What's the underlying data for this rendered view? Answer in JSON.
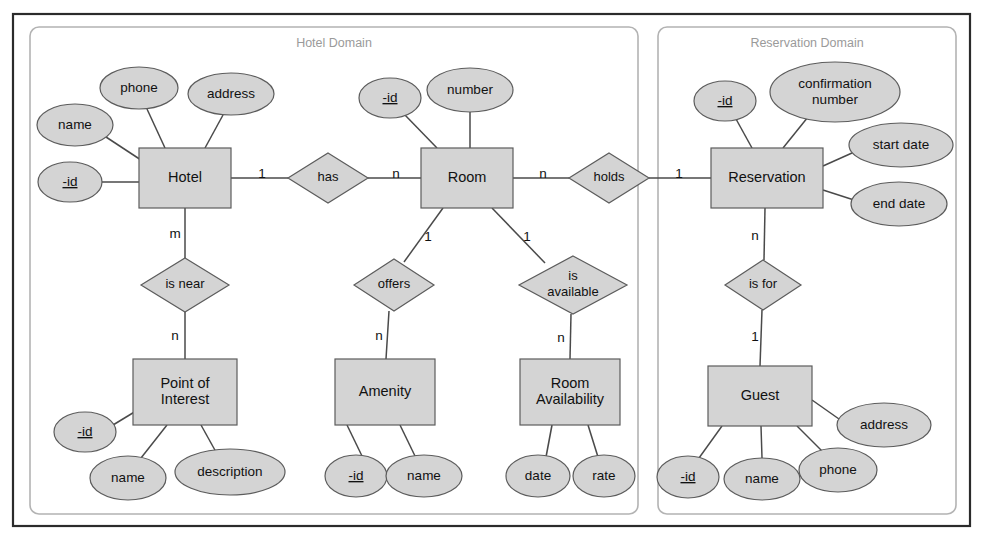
{
  "diagram": {
    "colors": {
      "shape_fill": "#d4d4d4",
      "shape_stroke": "#5c5c5c",
      "edge": "#4a4a4a",
      "domain_border": "#b3b3b3",
      "domain_label": "#9a9a9a",
      "outer_frame": "#2b2b2b",
      "background": "#ffffff"
    }
  },
  "domains": [
    {
      "id": "hotel-domain",
      "label": "Hotel Domain",
      "x": 30,
      "y": 27,
      "w": 608,
      "h": 487
    },
    {
      "id": "reservation-domain",
      "label": "Reservation Domain",
      "x": 658,
      "y": 27,
      "w": 298,
      "h": 487
    }
  ],
  "entities": [
    {
      "id": "hotel",
      "label": "Hotel",
      "cx": 185,
      "cy": 178,
      "w": 92,
      "h": 60,
      "lines": [
        "Hotel"
      ]
    },
    {
      "id": "room",
      "label": "Room",
      "cx": 467,
      "cy": 178,
      "w": 92,
      "h": 60,
      "lines": [
        "Room"
      ]
    },
    {
      "id": "reservation",
      "label": "Reservation",
      "cx": 767,
      "cy": 178,
      "w": 112,
      "h": 60,
      "lines": [
        "Reservation"
      ]
    },
    {
      "id": "point-of-interest",
      "label": "Point of Interest",
      "cx": 185,
      "cy": 392,
      "w": 104,
      "h": 66,
      "lines": [
        "Point of",
        "Interest"
      ]
    },
    {
      "id": "amenity",
      "label": "Amenity",
      "cx": 385,
      "cy": 392,
      "w": 100,
      "h": 66,
      "lines": [
        "Amenity"
      ]
    },
    {
      "id": "room-availability",
      "label": "Room Availability",
      "cx": 570,
      "cy": 392,
      "w": 100,
      "h": 66,
      "lines": [
        "Room",
        "Availability"
      ]
    },
    {
      "id": "guest",
      "label": "Guest",
      "cx": 760,
      "cy": 396,
      "w": 104,
      "h": 60,
      "lines": [
        "Guest"
      ]
    }
  ],
  "relationships": [
    {
      "id": "has",
      "label": "has",
      "cx": 328,
      "cy": 178,
      "rx": 40,
      "ry": 25,
      "lines": [
        "has"
      ]
    },
    {
      "id": "holds",
      "label": "holds",
      "cx": 609,
      "cy": 178,
      "rx": 40,
      "ry": 25,
      "lines": [
        "holds"
      ]
    },
    {
      "id": "is-near",
      "label": "is near",
      "cx": 185,
      "cy": 285,
      "rx": 44,
      "ry": 27,
      "lines": [
        "is near"
      ]
    },
    {
      "id": "offers",
      "label": "offers",
      "cx": 394,
      "cy": 285,
      "rx": 40,
      "ry": 26,
      "lines": [
        "offers"
      ]
    },
    {
      "id": "is-available",
      "label": "is available",
      "cx": 573,
      "cy": 285,
      "rx": 54,
      "ry": 29,
      "lines": [
        "is",
        "available"
      ]
    },
    {
      "id": "is-for",
      "label": "is for",
      "cx": 763,
      "cy": 285,
      "rx": 38,
      "ry": 25,
      "lines": [
        "is for"
      ]
    }
  ],
  "attributes": [
    {
      "id": "hotel-name",
      "label": "name",
      "key": false,
      "cx": 75,
      "cy": 125,
      "rx": 38,
      "ry": 21,
      "lines": [
        "name"
      ]
    },
    {
      "id": "hotel-phone",
      "label": "phone",
      "key": false,
      "cx": 139,
      "cy": 88,
      "rx": 39,
      "ry": 21,
      "lines": [
        "phone"
      ]
    },
    {
      "id": "hotel-address",
      "label": "address",
      "key": false,
      "cx": 231,
      "cy": 94,
      "rx": 43,
      "ry": 21,
      "lines": [
        "address"
      ]
    },
    {
      "id": "hotel-id",
      "label": "-id",
      "key": true,
      "cx": 70,
      "cy": 182,
      "rx": 32,
      "ry": 20,
      "lines": [
        "-id"
      ]
    },
    {
      "id": "room-id",
      "label": "-id",
      "key": true,
      "cx": 390,
      "cy": 98,
      "rx": 31,
      "ry": 20,
      "lines": [
        "-id"
      ]
    },
    {
      "id": "room-number",
      "label": "number",
      "key": false,
      "cx": 470,
      "cy": 90,
      "rx": 43,
      "ry": 22,
      "lines": [
        "number"
      ]
    },
    {
      "id": "reservation-id",
      "label": "-id",
      "key": true,
      "cx": 725,
      "cy": 101,
      "rx": 31,
      "ry": 20,
      "lines": [
        "-id"
      ]
    },
    {
      "id": "reservation-confirmation",
      "label": "confirmation number",
      "key": false,
      "cx": 835,
      "cy": 92,
      "rx": 65,
      "ry": 30,
      "lines": [
        "confirmation",
        "number"
      ]
    },
    {
      "id": "reservation-start-date",
      "label": "start date",
      "key": false,
      "cx": 901,
      "cy": 145,
      "rx": 52,
      "ry": 22,
      "lines": [
        "start date"
      ]
    },
    {
      "id": "reservation-end-date",
      "label": "end date",
      "key": false,
      "cx": 899,
      "cy": 204,
      "rx": 48,
      "ry": 22,
      "lines": [
        "end date"
      ]
    },
    {
      "id": "poi-id",
      "label": "-id",
      "key": true,
      "cx": 85,
      "cy": 432,
      "rx": 31,
      "ry": 20,
      "lines": [
        "-id"
      ]
    },
    {
      "id": "poi-name",
      "label": "name",
      "key": false,
      "cx": 128,
      "cy": 478,
      "rx": 38,
      "ry": 22,
      "lines": [
        "name"
      ]
    },
    {
      "id": "poi-description",
      "label": "description",
      "key": false,
      "cx": 230,
      "cy": 472,
      "rx": 55,
      "ry": 23,
      "lines": [
        "description"
      ]
    },
    {
      "id": "amenity-id",
      "label": "-id",
      "key": true,
      "cx": 356,
      "cy": 476,
      "rx": 31,
      "ry": 21,
      "lines": [
        "-id"
      ]
    },
    {
      "id": "amenity-name",
      "label": "name",
      "key": false,
      "cx": 424,
      "cy": 476,
      "rx": 38,
      "ry": 21,
      "lines": [
        "name"
      ]
    },
    {
      "id": "availability-date",
      "label": "date",
      "key": false,
      "cx": 538,
      "cy": 476,
      "rx": 32,
      "ry": 21,
      "lines": [
        "date"
      ]
    },
    {
      "id": "availability-rate",
      "label": "rate",
      "key": false,
      "cx": 604,
      "cy": 476,
      "rx": 31,
      "ry": 21,
      "lines": [
        "rate"
      ]
    },
    {
      "id": "guest-address",
      "label": "address",
      "key": false,
      "cx": 884,
      "cy": 425,
      "rx": 47,
      "ry": 22,
      "lines": [
        "address"
      ]
    },
    {
      "id": "guest-id",
      "label": "-id",
      "key": true,
      "cx": 688,
      "cy": 477,
      "rx": 31,
      "ry": 21,
      "lines": [
        "-id"
      ]
    },
    {
      "id": "guest-name",
      "label": "name",
      "key": false,
      "cx": 762,
      "cy": 479,
      "rx": 38,
      "ry": 21,
      "lines": [
        "name"
      ]
    },
    {
      "id": "guest-phone",
      "label": "phone",
      "key": false,
      "cx": 838,
      "cy": 470,
      "rx": 39,
      "ry": 22,
      "lines": [
        "phone"
      ]
    }
  ],
  "edges": [
    {
      "id": "e-hotel-name",
      "x1": 106,
      "y1": 137,
      "x2": 141,
      "y2": 160
    },
    {
      "id": "e-hotel-phone",
      "x1": 147,
      "y1": 109,
      "x2": 165,
      "y2": 148
    },
    {
      "id": "e-hotel-address",
      "x1": 223,
      "y1": 115,
      "x2": 205,
      "y2": 148
    },
    {
      "id": "e-hotel-id",
      "x1": 102,
      "y1": 182,
      "x2": 139,
      "y2": 182
    },
    {
      "id": "e-hotel-has",
      "x1": 231,
      "y1": 178,
      "x2": 288,
      "y2": 178
    },
    {
      "id": "e-has-room",
      "x1": 368,
      "y1": 178,
      "x2": 421,
      "y2": 178
    },
    {
      "id": "e-room-id",
      "x1": 404,
      "y1": 114,
      "x2": 437,
      "y2": 148
    },
    {
      "id": "e-room-number",
      "x1": 470,
      "y1": 112,
      "x2": 470,
      "y2": 148
    },
    {
      "id": "e-room-holds",
      "x1": 513,
      "y1": 178,
      "x2": 569,
      "y2": 178
    },
    {
      "id": "e-holds-reservation",
      "x1": 649,
      "y1": 178,
      "x2": 711,
      "y2": 178
    },
    {
      "id": "e-res-id",
      "x1": 736,
      "y1": 119,
      "x2": 752,
      "y2": 148
    },
    {
      "id": "e-res-confirm",
      "x1": 808,
      "y1": 117,
      "x2": 783,
      "y2": 148
    },
    {
      "id": "e-res-start",
      "x1": 852,
      "y1": 153,
      "x2": 823,
      "y2": 166
    },
    {
      "id": "e-res-end",
      "x1": 854,
      "y1": 200,
      "x2": 823,
      "y2": 190
    },
    {
      "id": "e-hotel-isnear",
      "x1": 185,
      "y1": 208,
      "x2": 185,
      "y2": 258
    },
    {
      "id": "e-isnear-poi",
      "x1": 185,
      "y1": 312,
      "x2": 185,
      "y2": 359
    },
    {
      "id": "e-room-offers",
      "x1": 443,
      "y1": 208,
      "x2": 404,
      "y2": 262
    },
    {
      "id": "e-offers-amenity",
      "x1": 389,
      "y1": 311,
      "x2": 386,
      "y2": 359
    },
    {
      "id": "e-room-isavail",
      "x1": 492,
      "y1": 208,
      "x2": 545,
      "y2": 263
    },
    {
      "id": "e-isavail-roomav",
      "x1": 571,
      "y1": 314,
      "x2": 570,
      "y2": 359
    },
    {
      "id": "e-res-isfor",
      "x1": 765,
      "y1": 208,
      "x2": 764,
      "y2": 260
    },
    {
      "id": "e-isfor-guest",
      "x1": 762,
      "y1": 310,
      "x2": 760,
      "y2": 366
    },
    {
      "id": "e-poi-id",
      "x1": 113,
      "y1": 425,
      "x2": 141,
      "y2": 408
    },
    {
      "id": "e-poi-name",
      "x1": 141,
      "y1": 458,
      "x2": 167,
      "y2": 425
    },
    {
      "id": "e-poi-desc",
      "x1": 216,
      "y1": 452,
      "x2": 201,
      "y2": 425
    },
    {
      "id": "e-amenity-id",
      "x1": 362,
      "y1": 456,
      "x2": 347,
      "y2": 425
    },
    {
      "id": "e-amenity-name",
      "x1": 415,
      "y1": 456,
      "x2": 400,
      "y2": 425
    },
    {
      "id": "e-av-date",
      "x1": 546,
      "y1": 457,
      "x2": 552,
      "y2": 425
    },
    {
      "id": "e-av-rate",
      "x1": 598,
      "y1": 457,
      "x2": 588,
      "y2": 425
    },
    {
      "id": "e-guest-address",
      "x1": 839,
      "y1": 419,
      "x2": 812,
      "y2": 400
    },
    {
      "id": "e-guest-id",
      "x1": 699,
      "y1": 458,
      "x2": 722,
      "y2": 426
    },
    {
      "id": "e-guest-name",
      "x1": 762,
      "y1": 458,
      "x2": 761,
      "y2": 426
    },
    {
      "id": "e-guest-phone",
      "x1": 823,
      "y1": 452,
      "x2": 797,
      "y2": 426
    }
  ],
  "cardinalities": [
    {
      "id": "card-hotel-has",
      "text": "1",
      "x": 262,
      "y": 174
    },
    {
      "id": "card-has-room",
      "text": "n",
      "x": 396,
      "y": 174
    },
    {
      "id": "card-room-holds",
      "text": "n",
      "x": 543,
      "y": 174
    },
    {
      "id": "card-holds-reservation",
      "text": "1",
      "x": 679,
      "y": 174
    },
    {
      "id": "card-hotel-isnear",
      "text": "m",
      "x": 175,
      "y": 234
    },
    {
      "id": "card-isnear-poi",
      "text": "n",
      "x": 175,
      "y": 336
    },
    {
      "id": "card-room-offers",
      "text": "1",
      "x": 428,
      "y": 237
    },
    {
      "id": "card-offers-amenity",
      "text": "n",
      "x": 379,
      "y": 336
    },
    {
      "id": "card-room-isavail",
      "text": "1",
      "x": 527,
      "y": 237
    },
    {
      "id": "card-isavail-roomav",
      "text": "n",
      "x": 561,
      "y": 338
    },
    {
      "id": "card-res-isfor",
      "text": "n",
      "x": 755,
      "y": 236
    },
    {
      "id": "card-isfor-guest",
      "text": "1",
      "x": 755,
      "y": 337
    }
  ]
}
